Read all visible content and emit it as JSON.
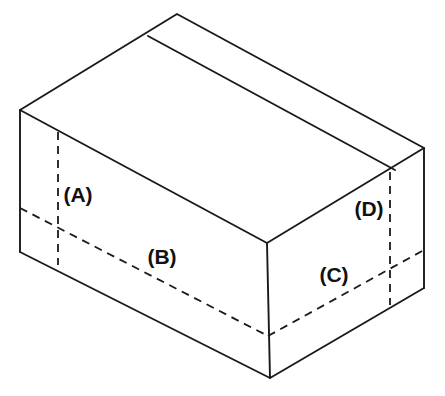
{
  "diagram": {
    "type": "isometric-box-line-drawing",
    "background_color": "#ffffff",
    "line_color": "#1a1a1a",
    "labels": [
      {
        "id": "A",
        "text": "(A)",
        "x": 78,
        "y": 196,
        "describes": "left-end vertical fold line"
      },
      {
        "id": "B",
        "text": "(B)",
        "x": 162,
        "y": 258,
        "describes": "front horizontal fold line"
      },
      {
        "id": "C",
        "text": "(C)",
        "x": 334,
        "y": 276,
        "describes": "right-side horizontal fold line"
      },
      {
        "id": "D",
        "text": "(D)",
        "x": 369,
        "y": 210,
        "describes": "right-end vertical fold line"
      }
    ],
    "vertices": {
      "top_left": {
        "x": 20,
        "y": 110
      },
      "top_back": {
        "x": 177,
        "y": 14
      },
      "top_right": {
        "x": 424,
        "y": 148
      },
      "top_front": {
        "x": 267,
        "y": 243
      },
      "bottom_left": {
        "x": 20,
        "y": 252
      },
      "bottom_front": {
        "x": 270,
        "y": 378
      },
      "bottom_right": {
        "x": 424,
        "y": 288
      }
    },
    "solid_edges": [
      {
        "name": "top-face-left-back",
        "from": [
          20,
          110
        ],
        "to": [
          177,
          14
        ]
      },
      {
        "name": "top-face-back-right",
        "from": [
          177,
          14
        ],
        "to": [
          424,
          148
        ]
      },
      {
        "name": "top-face-right-front",
        "from": [
          424,
          148
        ],
        "to": [
          267,
          243
        ]
      },
      {
        "name": "top-face-front-left",
        "from": [
          267,
          243
        ],
        "to": [
          20,
          110
        ]
      },
      {
        "name": "vertical-left",
        "from": [
          20,
          110
        ],
        "to": [
          20,
          252
        ]
      },
      {
        "name": "vertical-front",
        "from": [
          267,
          243
        ],
        "to": [
          270,
          378
        ]
      },
      {
        "name": "vertical-right",
        "from": [
          424,
          148
        ],
        "to": [
          424,
          288
        ]
      },
      {
        "name": "bottom-left-front",
        "from": [
          20,
          252
        ],
        "to": [
          270,
          378
        ]
      },
      {
        "name": "bottom-front-right",
        "from": [
          270,
          378
        ],
        "to": [
          424,
          288
        ]
      },
      {
        "name": "lid-seam",
        "from": [
          148,
          36
        ],
        "to": [
          395,
          170
        ]
      }
    ],
    "dashed_edges": [
      {
        "name": "fold-A-vertical-left",
        "from": [
          58,
          132
        ],
        "to": [
          58,
          265
        ]
      },
      {
        "name": "fold-B-horizontal-front",
        "from": [
          20,
          208
        ],
        "to": [
          268,
          336
        ]
      },
      {
        "name": "fold-C-horizontal-right",
        "from": [
          268,
          336
        ],
        "to": [
          424,
          250
        ]
      },
      {
        "name": "fold-D-vertical-right",
        "from": [
          390,
          172
        ],
        "to": [
          390,
          305
        ]
      }
    ]
  }
}
